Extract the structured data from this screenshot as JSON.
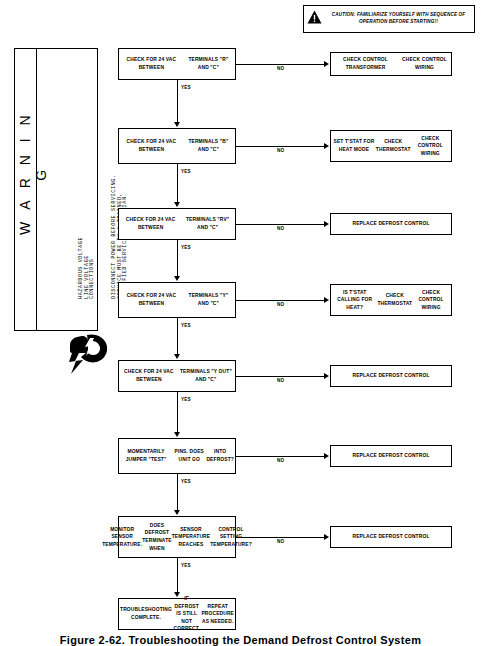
{
  "caution": {
    "icon": "warning-triangle-icon",
    "line1": "CAUTION: FAMILIARIZE YOURSELF WITH SEQUENCE OF",
    "line2": "OPERATION BEFORE STARTING!!"
  },
  "warning_panel": {
    "title": "W A R N I N G",
    "hazard_lines": "HAZARDOUS VOLTAGE\nLINE VOLTAGE\nCONNECTIONS",
    "service_lines": "DISCONNECT POWER BEFORE SERVICING.\nSERVICE MUST BE BY A TRAINED,\nQUALIFIED SERVICE TECHNICIAN.",
    "icon": "electric-shock-hand-icon"
  },
  "flow": {
    "yes_label": "YES",
    "no_label": "NO",
    "steps": [
      {
        "id": "step-1",
        "question": "CHECK FOR 24 VAC BETWEEN\nTERMINALS \"R\" AND \"C\"",
        "no_result": "CHECK CONTROL TRANSFORMER\nCHECK CONTROL WIRING"
      },
      {
        "id": "step-2",
        "question": "CHECK FOR 24 VAC BETWEEN\nTERMINALS \"B\" AND \"C\"",
        "no_result": "SET T'STAT FOR HEAT MODE\nCHECK THERMOSTAT\nCHECK CONTROL WIRING"
      },
      {
        "id": "step-3",
        "question": "CHECK FOR 24 VAC BETWEEN\nTERMINALS \"RV\" AND \"C\"",
        "no_result": "REPLACE DEFROST CONTROL"
      },
      {
        "id": "step-4",
        "question": "CHECK FOR 24 VAC BETWEEN\nTERMINALS \"Y\" AND \"C\"",
        "no_result": "IS T'STAT CALLING FOR HEAT?\nCHECK THERMOSTAT\nCHECK CONTROL WIRING"
      },
      {
        "id": "step-5",
        "question": "CHECK FOR 24 VAC BETWEEN\nTERMINALS \"Y OUT\" AND \"C\"",
        "no_result": "REPLACE DEFROST CONTROL"
      },
      {
        "id": "step-6",
        "question": "MOMENTARILY JUMPER \"TEST\"\nPINS. DOES UNIT GO\nINTO DEFROST?",
        "no_result": "REPLACE DEFROST CONTROL"
      },
      {
        "id": "step-7",
        "question": "MONITOR SENSOR TEMPERATURE.\nDOES DEFROST TERMINATE WHEN\nSENSOR TEMPERATURE REACHES\nCONTROL SETTING TEMPERATURE?",
        "no_result": "REPLACE DEFROST CONTROL"
      }
    ],
    "terminal": "TROUBLESHOOTING COMPLETE.\nIF DEFROST IS STILL NOT CORRECT,\nREPEAT PROCEDURE AS NEEDED."
  },
  "caption": "Figure 2-62.  Troubleshooting the Demand Defrost Control System"
}
